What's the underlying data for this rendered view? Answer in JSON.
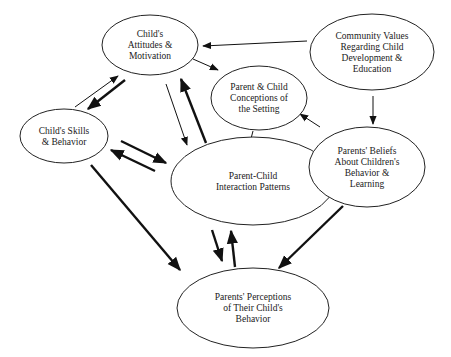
{
  "diagram": {
    "type": "influence-diagram",
    "nodes": [
      {
        "id": "attitudes",
        "lines": [
          "Child's",
          "Attitudes &",
          "Motivation"
        ],
        "cx": 150,
        "cy": 45,
        "rx": 48,
        "ry": 30
      },
      {
        "id": "community",
        "lines": [
          "Community Values",
          "Regarding Child",
          "Development &",
          "Education"
        ],
        "cx": 372,
        "cy": 52,
        "rx": 62,
        "ry": 38
      },
      {
        "id": "conceptions",
        "lines": [
          "Parent & Child",
          "Conceptions of",
          "the Setting"
        ],
        "cx": 259,
        "cy": 98,
        "rx": 48,
        "ry": 32
      },
      {
        "id": "skills",
        "lines": [
          "Child's Skills",
          "& Behavior"
        ],
        "cx": 64,
        "cy": 136,
        "rx": 44,
        "ry": 27
      },
      {
        "id": "interaction",
        "lines": [
          "Parent-Child",
          "Interaction Patterns"
        ],
        "cx": 253,
        "cy": 181,
        "rx": 82,
        "ry": 44
      },
      {
        "id": "beliefs",
        "lines": [
          "Parents' Beliefs",
          "About Children's",
          "Behavior &",
          "Learning"
        ],
        "cx": 367,
        "cy": 167,
        "rx": 58,
        "ry": 40
      },
      {
        "id": "perceptions",
        "lines": [
          "Parents' Perceptions",
          "of Their Child's",
          "Behavior"
        ],
        "cx": 253,
        "cy": 308,
        "rx": 76,
        "ry": 40
      }
    ],
    "edges": [
      {
        "from": "community",
        "to": "attitudes",
        "weight": "thin",
        "x1": 307,
        "y1": 41,
        "x2": 203,
        "y2": 46
      },
      {
        "from": "community",
        "to": "beliefs",
        "weight": "thin",
        "x1": 373,
        "y1": 96,
        "x2": 373,
        "y2": 124
      },
      {
        "from": "attitudes",
        "to": "conceptions",
        "weight": "thin",
        "x1": 193,
        "y1": 59,
        "x2": 218,
        "y2": 70
      },
      {
        "from": "beliefs",
        "to": "conceptions",
        "weight": "thin",
        "x1": 320,
        "y1": 127,
        "x2": 300,
        "y2": 114
      },
      {
        "from": "conceptions",
        "to": "interaction",
        "weight": "thin",
        "x1": 253,
        "y1": 131,
        "x2": 248,
        "y2": 150
      },
      {
        "from": "skills",
        "to": "attitudes",
        "weight": "thin",
        "x1": 75,
        "y1": 107,
        "x2": 118,
        "y2": 76
      },
      {
        "from": "attitudes",
        "to": "skills",
        "weight": "thick",
        "x1": 125,
        "y1": 80,
        "x2": 88,
        "y2": 109
      },
      {
        "from": "attitudes",
        "to": "interaction",
        "weight": "thin",
        "x1": 166,
        "y1": 84,
        "x2": 187,
        "y2": 145
      },
      {
        "from": "interaction",
        "to": "attitudes",
        "weight": "thick",
        "x1": 206,
        "y1": 143,
        "x2": 181,
        "y2": 79
      },
      {
        "from": "skills",
        "to": "interaction",
        "weight": "thick",
        "x1": 121,
        "y1": 141,
        "x2": 166,
        "y2": 163
      },
      {
        "from": "interaction",
        "to": "skills",
        "weight": "thick",
        "x1": 155,
        "y1": 171,
        "x2": 111,
        "y2": 150
      },
      {
        "from": "beliefs",
        "to": "interaction",
        "weight": "thick",
        "x1": 306,
        "y1": 174,
        "x2": 283,
        "y2": 181
      },
      {
        "from": "skills",
        "to": "perceptions",
        "weight": "thick",
        "x1": 91,
        "y1": 165,
        "x2": 180,
        "y2": 270
      },
      {
        "from": "interaction",
        "to": "perceptions",
        "weight": "thick",
        "x1": 212,
        "y1": 230,
        "x2": 222,
        "y2": 261
      },
      {
        "from": "perceptions",
        "to": "interaction",
        "weight": "thick",
        "x1": 235,
        "y1": 267,
        "x2": 231,
        "y2": 231
      },
      {
        "from": "beliefs",
        "to": "perceptions",
        "weight": "thick",
        "x1": 343,
        "y1": 206,
        "x2": 279,
        "y2": 268
      }
    ]
  }
}
